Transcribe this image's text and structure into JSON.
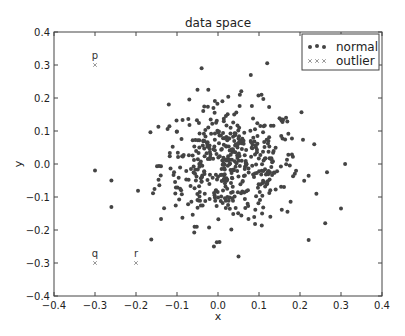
{
  "chart_data": {
    "type": "scatter",
    "title": "data space",
    "xlabel": "x",
    "ylabel": "y",
    "xlim": [
      -0.4,
      0.4
    ],
    "ylim": [
      -0.4,
      0.4
    ],
    "xticks": [
      "−0.4",
      "−0.3",
      "−0.2",
      "−0.1",
      "0.0",
      "0.1",
      "0.2",
      "0.3",
      "0.4"
    ],
    "yticks": [
      "0.4",
      "0.3",
      "0.2",
      "0.1",
      "0.0",
      "−0.1",
      "−0.2",
      "−0.3",
      "−0.4"
    ],
    "grid": false,
    "legend": {
      "position": "upper right",
      "entries": [
        "normal",
        "outlier"
      ]
    },
    "series": [
      {
        "name": "normal",
        "marker": "circle",
        "color": "#444444",
        "count_approx": 500,
        "distribution": "2D Gaussian centered near (0.03, 0.0), sd ~0.09 x, ~0.09 y",
        "notable_points": [
          {
            "x": 0.12,
            "y": 0.305
          },
          {
            "x": -0.04,
            "y": 0.29
          },
          {
            "x": 0.08,
            "y": 0.27
          },
          {
            "x": -0.05,
            "y": 0.225
          },
          {
            "x": -0.12,
            "y": 0.18
          },
          {
            "x": -0.3,
            "y": -0.02
          },
          {
            "x": -0.26,
            "y": -0.05
          },
          {
            "x": -0.26,
            "y": -0.13
          },
          {
            "x": 0.31,
            "y": 0.0
          },
          {
            "x": 0.3,
            "y": -0.135
          },
          {
            "x": 0.24,
            "y": -0.09
          },
          {
            "x": 0.05,
            "y": -0.28
          },
          {
            "x": -0.01,
            "y": -0.25
          }
        ]
      },
      {
        "name": "outlier",
        "marker": "x",
        "color": "#999999",
        "points": [
          {
            "x": -0.3,
            "y": 0.3,
            "label": "p"
          },
          {
            "x": -0.3,
            "y": -0.3,
            "label": "q"
          },
          {
            "x": -0.2,
            "y": -0.3,
            "label": "r"
          }
        ]
      }
    ]
  }
}
